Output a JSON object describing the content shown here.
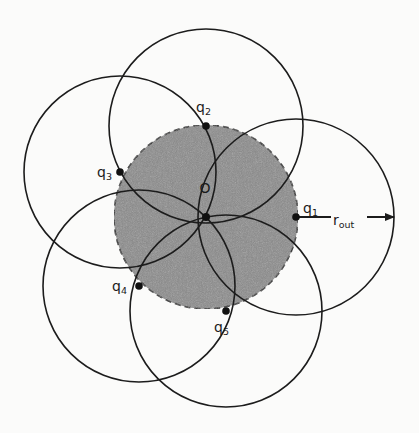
{
  "diagram": {
    "type": "coverage-circles",
    "background": "#fbfbfa",
    "inner_disk": {
      "center": [
        206,
        217
      ],
      "radius": 92,
      "fill": "#8a8a8a",
      "stroke": "#222222",
      "stroke_style": "dashed"
    },
    "center_point": {
      "label": "O",
      "position": [
        206,
        217
      ],
      "label_position": [
        205,
        193
      ]
    },
    "points": [
      {
        "id": "q1",
        "label": "q",
        "subscript": "1",
        "position": [
          296,
          217
        ],
        "circle_radius": 98,
        "label_position": [
          303,
          213
        ]
      },
      {
        "id": "q2",
        "label": "q",
        "subscript": "2",
        "position": [
          206,
          126
        ],
        "circle_radius": 97,
        "label_position": [
          196,
          112
        ]
      },
      {
        "id": "q3",
        "label": "q",
        "subscript": "3",
        "position": [
          120,
          172
        ],
        "circle_radius": 96,
        "label_position": [
          97,
          177
        ]
      },
      {
        "id": "q4",
        "label": "q",
        "subscript": "4",
        "position": [
          139,
          286
        ],
        "circle_radius": 96,
        "label_position": [
          112,
          291
        ]
      },
      {
        "id": "q5",
        "label": "q",
        "subscript": "5",
        "position": [
          226,
          311
        ],
        "circle_radius": 96,
        "label_position": [
          214,
          332
        ]
      }
    ],
    "radius_arrow": {
      "from": [
        296,
        217
      ],
      "to": [
        394,
        217
      ],
      "label": "r",
      "subscript": "out",
      "label_position": [
        333,
        225
      ]
    },
    "circle_stroke": "#1c1c1c"
  }
}
